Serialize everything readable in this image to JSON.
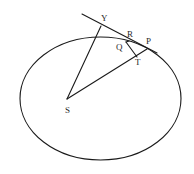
{
  "figure": {
    "labels": {
      "Y": "Y",
      "R": "R",
      "Q": "Q",
      "P": "P",
      "T": "T",
      "S": "S"
    },
    "colors": {
      "stroke": "#1a1a1a",
      "text": "#2a2a2a",
      "background": "#ffffff"
    }
  }
}
